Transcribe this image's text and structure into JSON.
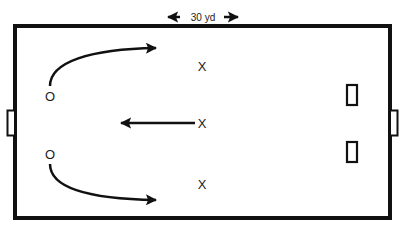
{
  "diagram": {
    "type": "soccer-drill",
    "dimension_label": "30 yd",
    "colors": {
      "line": "#111111",
      "background": "#ffffff"
    },
    "attackers": [
      {
        "label": "O",
        "x": 50,
        "y": 100
      },
      {
        "label": "O",
        "x": 50,
        "y": 158
      }
    ],
    "defenders": [
      {
        "label": "X",
        "x": 202,
        "y": 70
      },
      {
        "label": "X",
        "x": 202,
        "y": 128
      },
      {
        "label": "X",
        "x": 202,
        "y": 189
      }
    ],
    "goals": {
      "left_goal": "large",
      "right_goal": "large",
      "small_goals": 2
    }
  }
}
